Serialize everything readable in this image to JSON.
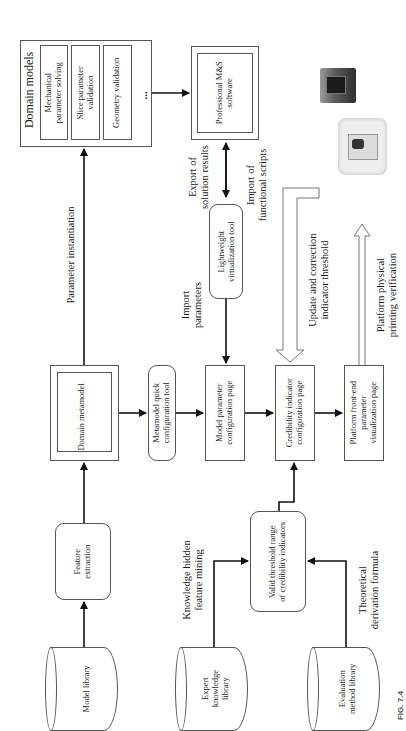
{
  "figure": {
    "caption": "FIG. 7.4",
    "domain_models": {
      "title": "Domain models",
      "items": [
        "Mechanical\nparameter solving",
        "Slice parameter\nvalidation",
        "Geometry validation"
      ],
      "ellipsis": "..."
    },
    "professional_software": "Professional M&S\nsoftware",
    "lightweight_tool": "Lightweight\nvirtualization tool",
    "domain_metamodel": "Domain metamodel",
    "metamodel_tool": "Metamodel quick\nconfiguration tool",
    "model_param_page": "Model parameter\nconfiguration page",
    "credibility_page": "Credibility indicator\nconfiguration page",
    "platform_page": "Platform front-end\nparameter\nvisualization page",
    "feature_extraction": "Feature\nextraction",
    "valid_threshold": "Valid threshold range\nof credibility indicators",
    "model_library": "Model library",
    "expert_library": "Expert\nknowledge\nlibrary",
    "evaluation_library": "Evaluation\nmethod library",
    "labels": {
      "parameter_instantiation": "Parameter instantiation",
      "import_parameters": "Import\nparameters",
      "export_results": "Export of\nsolution results",
      "import_scripts": "Import of\nfunctional scripts",
      "update_threshold": "Update and correction\nindicator threshold",
      "printing_verification": "Platform physical\nprinting verification",
      "knowledge_mining": "Knowledge hidden\nfeature mining",
      "theoretical_formula": "Theoretical\nderivation formula"
    },
    "images": [
      "3d-printer-dark",
      "3d-printer-white"
    ]
  }
}
